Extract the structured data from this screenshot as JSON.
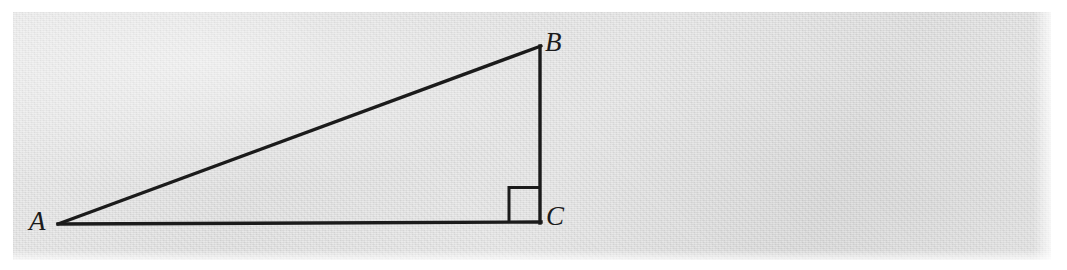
{
  "figure": {
    "kind": "right-triangle-diagram",
    "caption": "",
    "background_color": "#dedede",
    "page_color": "#ffffff",
    "stroke_color": "#1b1b1b",
    "labels": {
      "A": "A",
      "B": "B",
      "C": "C"
    },
    "vertices": {
      "A": {
        "x": 58,
        "y": 224
      },
      "B": {
        "x": 540,
        "y": 47
      },
      "C": {
        "x": 540,
        "y": 222
      }
    },
    "segments": [
      {
        "name": "hypotenuse-AB",
        "from": "A",
        "to": "B"
      },
      {
        "name": "leg-BC",
        "from": "B",
        "to": "C"
      },
      {
        "name": "leg-AC",
        "from": "A",
        "to": "C"
      }
    ],
    "right_angle_marker": {
      "at_vertex": "C",
      "x": 509,
      "y": 187,
      "size": 31
    }
  }
}
